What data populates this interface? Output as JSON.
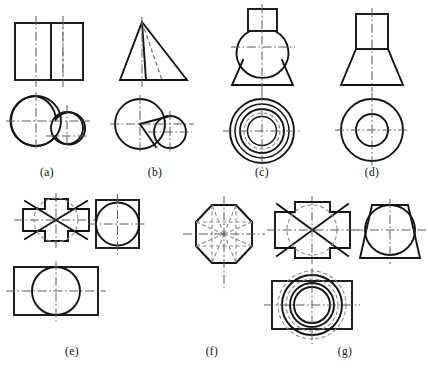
{
  "page": {
    "background_color": "#ffffff",
    "line_color": "#141414",
    "hidden_line_color": "#8a8a8a",
    "center_line_color": "#5a5a5a",
    "width": 428,
    "height": 372
  },
  "captions": {
    "a": "(a)",
    "b": "(b)",
    "c": "(c)",
    "d": "(d)",
    "e": "(e)",
    "f": "(f)",
    "g": "(g)"
  },
  "figures": [
    {
      "id": "a",
      "label": "(a)",
      "views": [
        {
          "name": "front-view",
          "type": "rectangle-with-divider",
          "description": "Rectangle split by a vertical solid line, dashed line right of divider, two vertical dash-dot centerlines"
        },
        {
          "name": "top-view",
          "type": "two-tangent-circles",
          "description": "Large left circle overlapping a smaller right circle with dash-dot centerlines"
        }
      ]
    },
    {
      "id": "b",
      "label": "(b)",
      "views": [
        {
          "name": "front-view",
          "type": "triangle",
          "description": "Isosceles triangle with one solid internal edge and one dashed internal edge from apex, vertical centerline"
        },
        {
          "name": "top-view",
          "type": "two-overlapping-circles-with-wedge",
          "description": "Large left circle and smaller right circle with two straight edges from left centre"
        }
      ]
    },
    {
      "id": "c",
      "label": "(c)",
      "views": [
        {
          "name": "front-view",
          "type": "rect-sphere-cone",
          "description": "Small rectangle on top, sphere in the middle, downward flaring truncated cone at bottom"
        },
        {
          "name": "top-view",
          "type": "concentric-circles",
          "description": "Four concentric solid circles plus one dashed circle with crossing centerlines"
        }
      ]
    },
    {
      "id": "d",
      "label": "(d)",
      "views": [
        {
          "name": "front-view",
          "type": "rect-on-trapezoid",
          "description": "Small rectangle on top of a widening trapezoid"
        },
        {
          "name": "top-view",
          "type": "two-concentric-circles",
          "description": "Outer circle with an inner concentric circle and crossing centerlines"
        }
      ]
    },
    {
      "id": "e",
      "label": "(e)",
      "views": [
        {
          "name": "top-view",
          "type": "cross-with-diagonals",
          "description": "Plus/cross outline with X diagonals and an inscribed dashed circle"
        },
        {
          "name": "side-view",
          "type": "tall-rectangle-with-circle",
          "description": "Vertical rectangle containing a circle tangent to the left and right edges"
        },
        {
          "name": "front-view",
          "type": "wide-rectangle-with-circle",
          "description": "Horizontal rectangle containing a circle tangent to the top and bottom edges"
        }
      ]
    },
    {
      "id": "f",
      "label": "(f)",
      "views": [
        {
          "name": "top-view",
          "type": "octagon-with-radial-lines",
          "description": "Regular octagon with dashed radial lines to each vertex and midpoint plus crossing centerlines"
        }
      ]
    },
    {
      "id": "g",
      "label": "(g)",
      "views": [
        {
          "name": "front-view",
          "type": "notched-rect-with-diagonals",
          "description": "Rectangle with a raised top tab and a lowered bottom tab, X diagonals and inscribed dashed circle"
        },
        {
          "name": "side-view",
          "type": "trapezoid-with-circle",
          "description": "Trapezoid narrowing upward containing a circle that passes beyond the top edge"
        },
        {
          "name": "top-view",
          "type": "rect-with-concentric-circles",
          "description": "Rectangle with two concentric solid circles and dashed circles extending beyond the rectangle"
        }
      ]
    }
  ]
}
